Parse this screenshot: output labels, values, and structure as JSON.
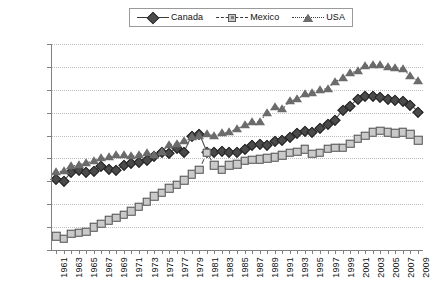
{
  "chart_data": {
    "type": "line",
    "title": "",
    "xlabel": "",
    "ylabel": "",
    "ylim": [
      2200,
      4000
    ],
    "ytick_step": 200,
    "grid": true,
    "legend_position": "top-center",
    "yticks": [
      "4,000",
      "3,800",
      "3,600",
      "3,400",
      "3,200",
      "3,000",
      "2,800",
      "2,600",
      "2,400",
      "2,200"
    ],
    "x": [
      1961,
      1962,
      1963,
      1964,
      1965,
      1966,
      1967,
      1968,
      1969,
      1970,
      1971,
      1972,
      1973,
      1974,
      1975,
      1976,
      1977,
      1978,
      1979,
      1980,
      1981,
      1982,
      1983,
      1984,
      1985,
      1986,
      1987,
      1988,
      1989,
      1990,
      1991,
      1992,
      1993,
      1994,
      1995,
      1996,
      1997,
      1998,
      1999,
      2000,
      2001,
      2002,
      2003,
      2004,
      2005,
      2006,
      2007,
      2008,
      2009
    ],
    "xtick_labels": [
      "1961",
      "",
      "1963",
      "",
      "1965",
      "",
      "1967",
      "",
      "1969",
      "",
      "1971",
      "",
      "1973",
      "",
      "1975",
      "",
      "1977",
      "",
      "1979",
      "",
      "1981",
      "",
      "1983",
      "",
      "1985",
      "",
      "1987",
      "",
      "1989",
      "",
      "1991",
      "",
      "1993",
      "",
      "1995",
      "",
      "1997",
      "",
      "1999",
      "",
      "2001",
      "",
      "2003",
      "",
      "2005",
      "",
      "2007",
      "",
      "2009"
    ],
    "series": [
      {
        "name": "Canada",
        "marker": "diamond",
        "line_style": "solid",
        "color": "#4a4a4a",
        "values": [
          2820,
          2800,
          2880,
          2900,
          2880,
          2890,
          2930,
          2910,
          2900,
          2940,
          2960,
          2970,
          2990,
          3020,
          3060,
          3050,
          3090,
          3060,
          3200,
          3215,
          3060,
          3060,
          3065,
          3060,
          3060,
          3080,
          3120,
          3130,
          3120,
          3150,
          3160,
          3190,
          3220,
          3240,
          3235,
          3265,
          3305,
          3340,
          3420,
          3460,
          3520,
          3545,
          3550,
          3540,
          3520,
          3510,
          3500,
          3470,
          3410
        ]
      },
      {
        "name": "Mexico",
        "marker": "square",
        "line_style": "dashed",
        "color": "#cacaca",
        "values": [
          2320,
          2300,
          2340,
          2350,
          2360,
          2400,
          2430,
          2460,
          2480,
          2510,
          2540,
          2580,
          2620,
          2670,
          2700,
          2740,
          2770,
          2810,
          2860,
          2900,
          3050,
          2940,
          2900,
          2940,
          2950,
          2980,
          2990,
          2995,
          3000,
          3010,
          3030,
          3050,
          3060,
          3080,
          3040,
          3050,
          3085,
          3095,
          3095,
          3130,
          3170,
          3200,
          3230,
          3240,
          3230,
          3220,
          3230,
          3210,
          3160
        ]
      },
      {
        "name": "USA",
        "marker": "triangle",
        "line_style": "dotted",
        "color": "#6b6b6b",
        "values": [
          2880,
          2890,
          2930,
          2945,
          2960,
          2980,
          3000,
          3010,
          3030,
          3030,
          3020,
          3030,
          3050,
          3030,
          3060,
          3120,
          3130,
          3150,
          3190,
          3200,
          3210,
          3200,
          3220,
          3230,
          3260,
          3290,
          3320,
          3320,
          3400,
          3450,
          3430,
          3500,
          3520,
          3560,
          3570,
          3600,
          3610,
          3670,
          3700,
          3750,
          3760,
          3810,
          3820,
          3815,
          3800,
          3790,
          3780,
          3720,
          3680
        ]
      }
    ]
  },
  "legend": {
    "items": [
      {
        "label": "Canada",
        "icon": "diamond-marker-icon"
      },
      {
        "label": "Mexico",
        "icon": "square-marker-icon"
      },
      {
        "label": "USA",
        "icon": "triangle-marker-icon"
      }
    ]
  }
}
